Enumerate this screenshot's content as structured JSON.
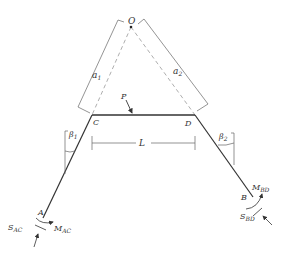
{
  "diagram": {
    "points": {
      "O": "O",
      "C": "C",
      "D": "D",
      "A": "A",
      "B": "B",
      "P": "P"
    },
    "dimensions": {
      "a1": {
        "main": "a",
        "sub": "1"
      },
      "a2": {
        "main": "a",
        "sub": "2"
      },
      "L": "L",
      "beta1": {
        "main": "β",
        "sub": "1"
      },
      "beta2": {
        "main": "β",
        "sub": "2"
      }
    },
    "forces": {
      "S_AC": {
        "main": "S",
        "sub": "AC"
      },
      "M_AC": {
        "main": "M",
        "sub": "AC"
      },
      "S_BD": {
        "main": "S",
        "sub": "BD"
      },
      "M_BD": {
        "main": "M",
        "sub": "BD"
      }
    },
    "colors": {
      "member": "#333333",
      "dashed": "#999999",
      "dim": "#666666"
    }
  }
}
